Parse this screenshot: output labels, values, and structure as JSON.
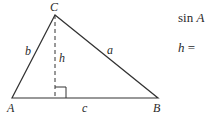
{
  "diagram": {
    "type": "triangle-with-altitude",
    "vertices": {
      "A": {
        "label": "A",
        "x": 12,
        "y": 98
      },
      "B": {
        "label": "B",
        "x": 158,
        "y": 98
      },
      "C": {
        "label": "C",
        "x": 55,
        "y": 15
      }
    },
    "sides": {
      "a": {
        "label": "a",
        "between": "B-C"
      },
      "b": {
        "label": "b",
        "between": "A-C"
      },
      "c": {
        "label": "c",
        "between": "A-B"
      }
    },
    "altitude": {
      "label": "h",
      "from": "C",
      "style": "dashed",
      "right_angle_marker": true
    },
    "stroke_color": "#333333"
  },
  "equations": {
    "line1_func": "sin",
    "line1_var": "A",
    "line2_var": "h",
    "line2_op": "="
  }
}
